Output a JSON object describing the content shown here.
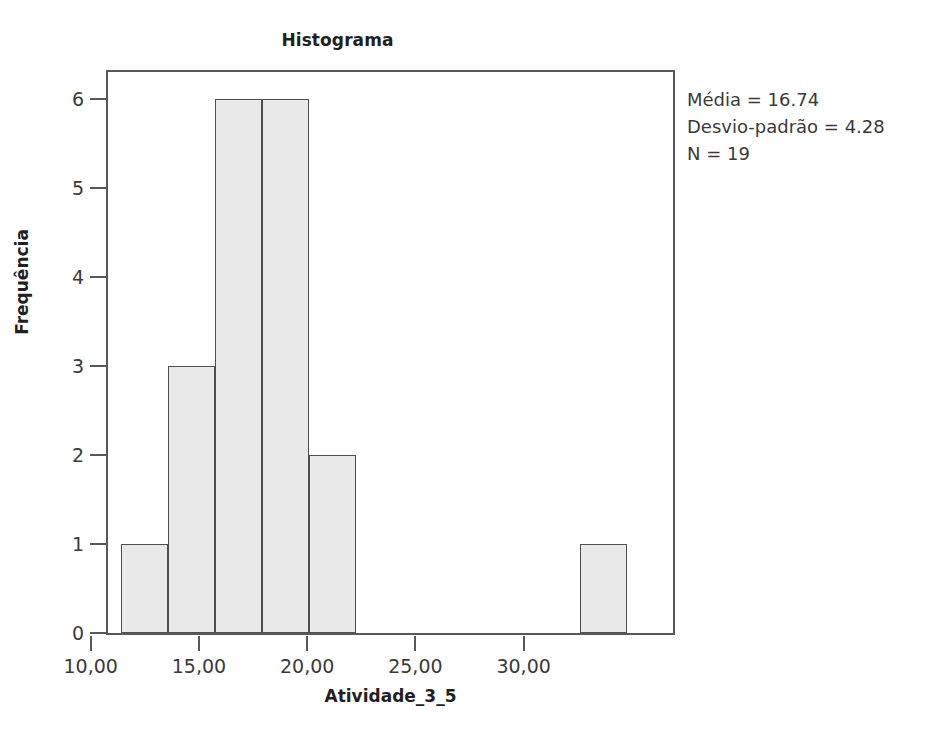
{
  "chart_data": {
    "type": "bar",
    "title": "Histograma",
    "xlabel": "Atividade_3_5",
    "ylabel": "Frequência",
    "xlim": [
      10.8,
      36.9
    ],
    "ylim": [
      0,
      6.3
    ],
    "grid": false,
    "legend_position": "right",
    "x_ticks": [
      {
        "value": 10,
        "label": "10,00"
      },
      {
        "value": 15,
        "label": "15,00"
      },
      {
        "value": 20,
        "label": "20,00"
      },
      {
        "value": 25,
        "label": "25,00"
      },
      {
        "value": 30,
        "label": "30,00"
      }
    ],
    "y_ticks": [
      {
        "value": 0,
        "label": "0"
      },
      {
        "value": 1,
        "label": "1"
      },
      {
        "value": 2,
        "label": "2"
      },
      {
        "value": 3,
        "label": "3"
      },
      {
        "value": 4,
        "label": "4"
      },
      {
        "value": 5,
        "label": "5"
      },
      {
        "value": 6,
        "label": "6"
      }
    ],
    "bin_width": 2.17,
    "bins": [
      {
        "x0": 11.42,
        "x1": 13.59,
        "value": 1
      },
      {
        "x0": 13.59,
        "x1": 15.76,
        "value": 3
      },
      {
        "x0": 15.76,
        "x1": 17.93,
        "value": 6
      },
      {
        "x0": 17.93,
        "x1": 20.1,
        "value": 6
      },
      {
        "x0": 20.1,
        "x1": 22.27,
        "value": 2
      },
      {
        "x0": 32.62,
        "x1": 34.79,
        "value": 1
      }
    ],
    "values": [
      1,
      3,
      6,
      6,
      2,
      1
    ],
    "annotations": [
      "Média = 16.74",
      "Desvio-padrão = 4.28",
      "N = 19"
    ],
    "colors": {
      "bar_fill": "#e9e9e9",
      "bar_border": "#4f4f51",
      "axis": "#58585a",
      "text": "#231f20",
      "background": "#ffffff"
    }
  },
  "stats": {
    "mean_label": "Média = 16.74",
    "sd_label": "Desvio-padrão = 4.28",
    "n_label": "N = 19"
  }
}
